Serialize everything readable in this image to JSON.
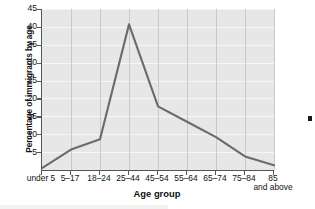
{
  "chart_data": {
    "type": "line",
    "title": "",
    "xlabel": "Age group",
    "ylabel": "Percentage of immigrants by age",
    "categories": [
      "under 5",
      "5–17",
      "18–24",
      "25–44",
      "45–54",
      "55–64",
      "65–74",
      "75–84",
      "85 and above"
    ],
    "values": [
      0.5,
      5.7,
      8.6,
      40.7,
      17.8,
      13.5,
      9.2,
      3.8,
      1.3
    ],
    "series": [
      {
        "name": "Percentage of immigrants by age",
        "values": [
          0.5,
          5.7,
          8.6,
          40.7,
          17.8,
          13.5,
          9.2,
          3.8,
          1.3
        ]
      }
    ],
    "ylim": [
      0,
      45
    ],
    "yticks": [
      5,
      10,
      15,
      20,
      25,
      30,
      35,
      40,
      45
    ],
    "ytick_labels": [
      "5",
      "10",
      "15",
      "20",
      "25",
      "30",
      "35",
      "40",
      "45"
    ],
    "grid": true,
    "legend": false,
    "legend_position": "none",
    "line_color": "#6b6b6b",
    "plot_background": "#e7e7e7",
    "gridline_color": "#f6f6f6",
    "axis_color": "#555555"
  },
  "xaxis": {
    "title": "Age group",
    "ticks": [
      {
        "line1": "under 5",
        "line2": ""
      },
      {
        "line1": "5–17",
        "line2": ""
      },
      {
        "line1": "18–24",
        "line2": ""
      },
      {
        "line1": "25–44",
        "line2": ""
      },
      {
        "line1": "45–54",
        "line2": ""
      },
      {
        "line1": "55–64",
        "line2": ""
      },
      {
        "line1": "65–74",
        "line2": ""
      },
      {
        "line1": "75–84",
        "line2": ""
      },
      {
        "line1": "85",
        "line2": "and above"
      }
    ]
  },
  "yaxis": {
    "title": "Percentage of immigrants by age",
    "ticks": [
      "45",
      "40",
      "35",
      "30",
      "25",
      "20",
      "15",
      "10",
      "5"
    ]
  }
}
